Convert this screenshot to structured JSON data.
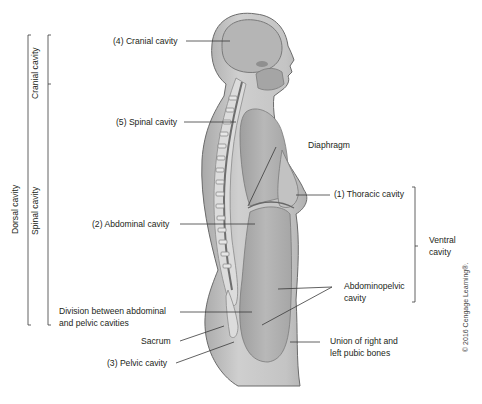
{
  "figure": {
    "type": "anatomical-diagram",
    "colors": {
      "body_fill": "#c9c9c9",
      "body_shadow": "#a8a8a8",
      "cavity_fill": "#b3b3b3",
      "highlight": "#e4e4e4",
      "line": "#3a3a3a"
    }
  },
  "brackets": {
    "dorsal": {
      "label": "Dorsal cavity"
    },
    "cranial": {
      "label": "Cranial cavity"
    },
    "spinal": {
      "label": "Spinal cavity"
    },
    "ventral": {
      "label_line1": "Ventral",
      "label_line2": "cavity"
    }
  },
  "labels": {
    "cranial": "(4) Cranial cavity",
    "spinal": "(5) Spinal cavity",
    "diaphragm": "Diaphragm",
    "thoracic": "(1) Thoracic cavity",
    "abdominal": "(2) Abdominal cavity",
    "abdominopelvic_line1": "Abdominopelvic",
    "abdominopelvic_line2": "cavity",
    "division_line1": "Division between abdominal",
    "division_line2": "and pelvic cavities",
    "sacrum": "Sacrum",
    "pelvic": "(3) Pelvic cavity",
    "pubic_line1": "Union of right and",
    "pubic_line2": "left pubic bones"
  },
  "copyright": "© 2016 Cengage Learning®."
}
